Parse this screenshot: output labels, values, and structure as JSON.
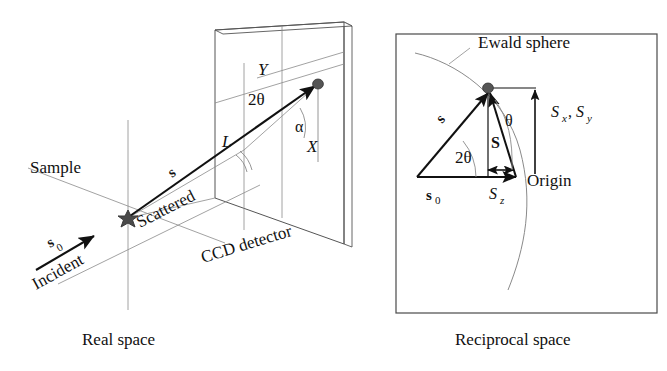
{
  "figure": {
    "type": "scientific-diagram"
  },
  "panels": {
    "left": {
      "caption": "Real space",
      "labels": {
        "sample": "Sample",
        "incident": "Incident",
        "s0": "s",
        "s0_sub": "0",
        "scattered": "Scattered",
        "s_vector": "s",
        "detector": "CCD detector",
        "L": "L",
        "X": "X",
        "Y": "Y",
        "two_theta": "2θ",
        "alpha": "α"
      }
    },
    "right": {
      "caption": "Reciprocal space",
      "labels": {
        "ewald": "Ewald sphere",
        "s_vector": "s",
        "s0": "s",
        "s0_sub": "0",
        "S_vector": "S",
        "Sz": "S",
        "Sz_sub": "z",
        "Sxy": "S",
        "Sxy_sub1": "x",
        "Sxy_comma": ",",
        "Sxy_2": "S",
        "Sxy_sub2": "y",
        "origin": "Origin",
        "two_theta": "2θ",
        "theta": "θ"
      }
    }
  },
  "colors": {
    "ink": "#111111",
    "thin_line": "#6a6a6a",
    "spot": "#4a4a4a",
    "box_border": "#4a4a4a",
    "background": "#ffffff"
  }
}
